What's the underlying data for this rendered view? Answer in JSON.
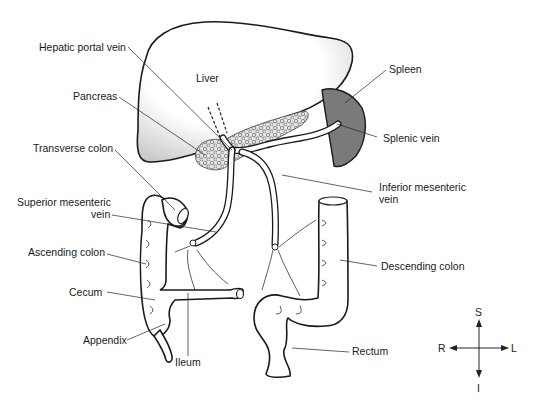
{
  "labels": {
    "liver": "Liver",
    "hepatic_portal_vein": "Hepatic portal vein",
    "pancreas": "Pancreas",
    "transverse_colon": "Transverse colon",
    "superior_mesenteric_vein_line1": "Superior mesenteric",
    "superior_mesenteric_vein_line2": "vein",
    "ascending_colon": "Ascending colon",
    "cecum": "Cecum",
    "appendix": "Appendix",
    "ileum": "Ileum",
    "spleen": "Spleen",
    "splenic_vein": "Splenic vein",
    "inferior_mesenteric_vein_line1": "Inferior mesenteric",
    "inferior_mesenteric_vein_line2": "vein",
    "descending_colon": "Descending colon",
    "rectum": "Rectum"
  },
  "compass": {
    "superior": "S",
    "inferior": "I",
    "right": "R",
    "left": "L"
  },
  "colors": {
    "spleen": "#7a7a7a",
    "pancreas_dots": "#8a8a8a",
    "liver_shade": "#d0d0d0",
    "outline": "#1a1a1a"
  }
}
